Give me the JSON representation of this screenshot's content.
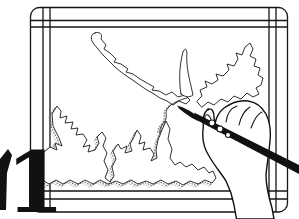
{
  "illustration": {
    "description": "Black-and-white line illustration of a hand holding a drawing pen, tracing a jagged coastline map on a framed drawing board; a large bold numeral is cropped at the lower-left edge",
    "numeral": "1"
  },
  "colors": {
    "ink": "#111111",
    "paper": "#ffffff",
    "stipple": "#6b6b6b"
  }
}
